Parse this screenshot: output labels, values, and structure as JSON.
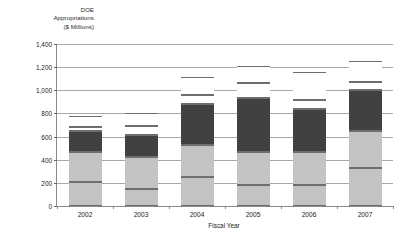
{
  "chart_data": {
    "type": "bar",
    "subtype": "stacked-bar",
    "title": "DOE Appropriations ($ Millions)",
    "title_lines": [
      "DOE",
      "Appropriations",
      "($ Millions)"
    ],
    "xlabel": "Fiscal Year",
    "ylabel": "DOE Appropriations ($ Millions)",
    "categories": [
      "2002",
      "2003",
      "2004",
      "2005",
      "2006",
      "2007"
    ],
    "ylim": [
      0,
      1400
    ],
    "ytick_labels": [
      "0",
      "200",
      "400",
      "600",
      "800",
      "1,000",
      "1,200",
      "1,400"
    ],
    "ytick_values": [
      0,
      200,
      400,
      600,
      800,
      1000,
      1200,
      1400
    ],
    "grid": true,
    "legend": "none",
    "series": [
      {
        "name": "Segment 1",
        "color": "#c3c3c3",
        "values": [
          205,
          150,
          250,
          185,
          185,
          325
        ]
      },
      {
        "name": "Segment 2",
        "color": "#c3c3c3",
        "values": [
          265,
          275,
          280,
          280,
          280,
          320
        ]
      },
      {
        "name": "Segment 3",
        "color": "#414141",
        "values": [
          180,
          185,
          350,
          470,
          370,
          355
        ]
      },
      {
        "name": "Segment 4",
        "color": "#ffffff",
        "values": [
          30,
          80,
          80,
          130,
          85,
          70
        ]
      },
      {
        "name": "Segment 5",
        "color": "#ffffff",
        "values": [
          100,
          110,
          155,
          145,
          240,
          180
        ]
      }
    ],
    "totals": [
      780,
      800,
      1115,
      1210,
      1160,
      1250
    ]
  }
}
